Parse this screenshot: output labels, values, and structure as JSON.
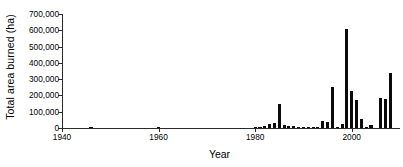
{
  "chart_data": {
    "type": "bar",
    "title": "",
    "xlabel": "Year",
    "ylabel": "Total area burned (ha)",
    "xlim": [
      1940,
      2010
    ],
    "ylim": [
      0,
      700000
    ],
    "grid": false,
    "legend": null,
    "bar_color": "#0a0a0a",
    "axis_color": "#2b2b2b",
    "xticks": [
      1940,
      1960,
      1980,
      2000
    ],
    "xticklabels": [
      "1940",
      "1960",
      "1980",
      "2000"
    ],
    "yticks": [
      0,
      100000,
      200000,
      300000,
      400000,
      500000,
      600000,
      700000
    ],
    "yticklabels": [
      "0",
      "100,000",
      "200,000",
      "300,000",
      "400,000",
      "500,000",
      "600,000",
      "700,000"
    ],
    "x": [
      1941,
      1942,
      1943,
      1944,
      1945,
      1946,
      1947,
      1948,
      1949,
      1950,
      1951,
      1952,
      1953,
      1954,
      1955,
      1956,
      1957,
      1958,
      1959,
      1960,
      1961,
      1962,
      1963,
      1964,
      1965,
      1966,
      1967,
      1968,
      1969,
      1970,
      1971,
      1972,
      1973,
      1974,
      1975,
      1976,
      1977,
      1978,
      1979,
      1980,
      1981,
      1982,
      1983,
      1984,
      1985,
      1986,
      1987,
      1988,
      1989,
      1990,
      1991,
      1992,
      1993,
      1994,
      1995,
      1996,
      1997,
      1998,
      1999,
      2000,
      2001,
      2002,
      2003,
      2004,
      2005,
      2006,
      2007,
      2008
    ],
    "values": [
      0,
      0,
      0,
      0,
      0,
      2500,
      0,
      0,
      0,
      0,
      0,
      0,
      0,
      0,
      0,
      0,
      0,
      0,
      0,
      2500,
      0,
      0,
      0,
      0,
      0,
      0,
      0,
      0,
      0,
      0,
      0,
      0,
      0,
      0,
      0,
      0,
      0,
      0,
      0,
      3000,
      9000,
      14000,
      22000,
      33000,
      150000,
      16000,
      14000,
      13000,
      8000,
      4000,
      3000,
      3000,
      4000,
      42000,
      38000,
      250000,
      5000,
      25000,
      605000,
      225000,
      170000,
      55000,
      4000,
      18000,
      0,
      183000,
      178000,
      335000
    ],
    "units": "ha"
  }
}
